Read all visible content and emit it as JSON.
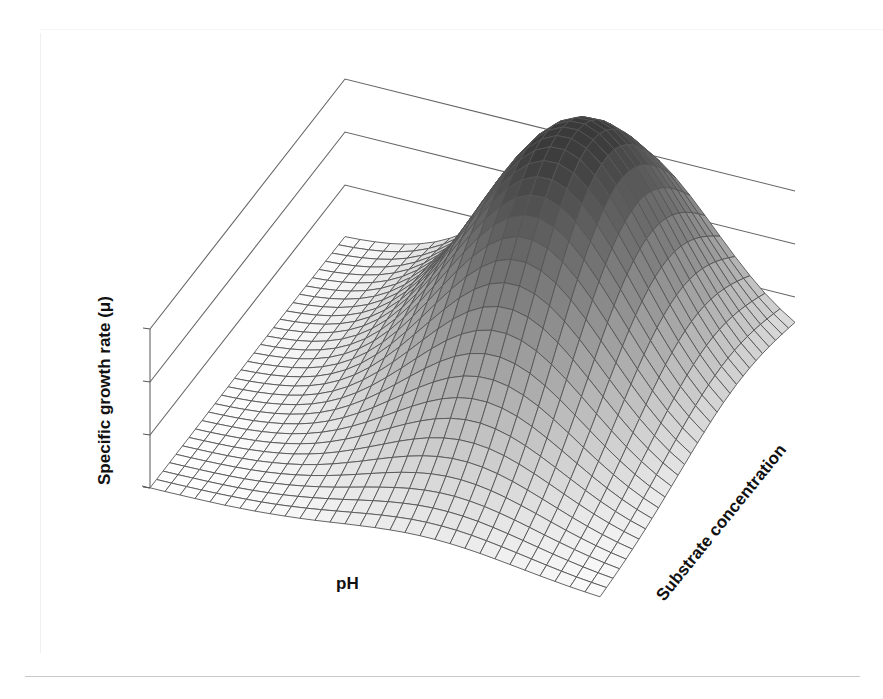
{
  "chart_data": {
    "type": "surface3d",
    "title": "",
    "xlabel": "pH",
    "ylabel": "Substrate concentration",
    "zlabel": "Specific growth rate (μ)",
    "z_ticks": 4,
    "z_tick_labels": [],
    "grid": {
      "nx": 30,
      "ny": 30
    },
    "surface": {
      "function": "gaussian_peak",
      "peak_x": 0.62,
      "peak_y": 0.72,
      "sigma_x": 0.2,
      "sigma_y": 0.32,
      "baseline": 0.0,
      "peak_height": 1.0
    },
    "shading": {
      "peak_color": "#3a3a3a",
      "base_color": "#ffffff",
      "mesh_color": "#555555"
    },
    "back_walls": {
      "count": 3,
      "line_color": "#666666"
    },
    "axis_ranges": {
      "x": [
        0,
        1
      ],
      "y": [
        0,
        1
      ],
      "z": [
        0,
        1
      ]
    }
  },
  "labels": {
    "z_axis": "Specific growth rate (μ)",
    "x_axis": "pH",
    "y_axis": "Substrate concentration"
  }
}
